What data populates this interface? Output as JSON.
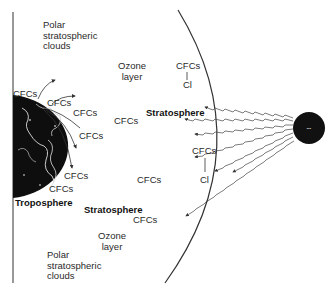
{
  "diagram": {
    "labels": {
      "psc_top": "Polar stratospheric clouds",
      "psc_top_lines": [
        "Polar",
        "stratospheric",
        "clouds"
      ],
      "ozone_top_lines": [
        "Ozone",
        "layer"
      ],
      "cfc_top_right": "CFCs",
      "cl_top_right": "Cl",
      "stratosphere_upper": "Stratosphere",
      "cfc_mid_left": "CFCs",
      "cfc_earth_1": "CFCs",
      "cfc_earth_2": "CFCs",
      "cfc_earth_3": "CFCs",
      "cfc_earth_4": "CFCs",
      "cfc_earth_5": "CFCs",
      "cfc_earth_6": "CFCs",
      "cfc_lower_right": "CFCs",
      "cl_lower_right": "Cl",
      "cfc_lower_mid": "CFCs",
      "troposphere": "Troposphere",
      "stratosphere_lower": "Stratosphere",
      "cfc_lower_strat": "CFCs",
      "ozone_bottom_lines": [
        "Ozone",
        "layer"
      ],
      "psc_bottom_lines": [
        "Polar",
        "stratospheric",
        "clouds"
      ]
    },
    "icons": {
      "earth": "earth-globe-icon",
      "sun": "sun-icon"
    },
    "colors": {
      "ink": "#222222",
      "earth": "#111111",
      "background": "#ffffff"
    }
  }
}
